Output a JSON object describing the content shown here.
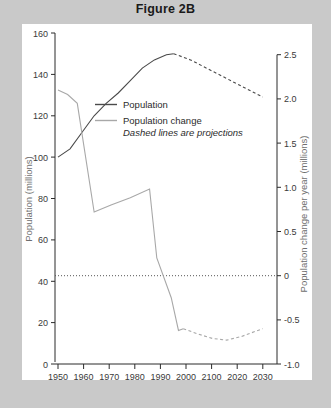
{
  "figure": {
    "title": "Figure 2B",
    "background_color": "#c9c9c9",
    "card_color": "#ffffff"
  },
  "chart_data": {
    "type": "line",
    "title": "Figure 2B",
    "xlabel": "Year",
    "ylabel": "Population (millions)",
    "y2label": "Population change per year (millions)",
    "xlim": [
      1950,
      2035
    ],
    "ylim": [
      0,
      160
    ],
    "y2lim": [
      -1.0,
      2.5
    ],
    "grid": false,
    "legend_position": "upper-center-left",
    "legend_note": "Dashed lines are projections",
    "x_ticks": [
      1950,
      1960,
      1970,
      1980,
      1990,
      2000,
      2100,
      2020,
      2030
    ],
    "y_ticks": [
      0,
      20,
      40,
      60,
      80,
      100,
      120,
      140,
      160
    ],
    "y2_ticks": [
      -1.0,
      -0.5,
      0,
      0.5,
      1.0,
      1.5,
      2.0,
      2.5
    ],
    "y2_tick_labels": [
      "-1.0",
      "-0.5",
      "0",
      "0.5",
      "1.0",
      "1.5",
      "2.0",
      "2.5"
    ],
    "zero_reference_line": 0,
    "series": [
      {
        "name": "Population",
        "axis": "left",
        "color": "#4a4a4a",
        "observed": {
          "x": [
            1950,
            1955,
            1960,
            1965,
            1970,
            1975,
            1980,
            1985,
            1990,
            1995,
            1998
          ],
          "y": [
            100,
            104,
            112,
            120,
            126,
            131,
            137,
            143,
            147,
            149.5,
            150
          ]
        },
        "projected": {
          "x": [
            1998,
            2005,
            2010,
            2015,
            2020,
            2025,
            2030,
            2035
          ],
          "y": [
            150,
            147,
            144,
            141,
            138,
            135,
            132,
            129
          ]
        }
      },
      {
        "name": "Population change",
        "axis": "right",
        "color": "#a8a8a8",
        "observed": {
          "x": [
            1950,
            1954,
            1958,
            1965,
            1972,
            1980,
            1988,
            1991,
            1997,
            2000,
            2002
          ],
          "y": [
            2.1,
            2.05,
            1.95,
            0.72,
            0.8,
            0.88,
            0.98,
            0.2,
            -0.25,
            -0.62,
            -0.6
          ]
        },
        "projected": {
          "x": [
            2002,
            2008,
            2014,
            2020,
            2026,
            2032,
            2035
          ],
          "y": [
            -0.6,
            -0.66,
            -0.71,
            -0.73,
            -0.69,
            -0.63,
            -0.6
          ]
        }
      }
    ]
  },
  "legend": {
    "items": [
      {
        "label": "Population",
        "color": "#4a4a4a"
      },
      {
        "label": "Population change",
        "color": "#a8a8a8"
      }
    ],
    "note": "Dashed lines are projections"
  },
  "axes": {
    "x_title": "Year",
    "y_left_title": "Population (millions)",
    "y_right_title": "Population change per year (millions)",
    "x_tick_labels": [
      "1950",
      "1960",
      "1970",
      "1980",
      "1990",
      "2000",
      "2100",
      "2020",
      "2030"
    ],
    "y_left_tick_labels": [
      "160",
      "140",
      "120",
      "100",
      "80",
      "60",
      "40",
      "20",
      "0"
    ],
    "y_right_tick_labels": [
      "2.5",
      "2.0",
      "1.5",
      "1.0",
      "0.5",
      "0",
      "-0.5",
      "-1.0"
    ]
  }
}
